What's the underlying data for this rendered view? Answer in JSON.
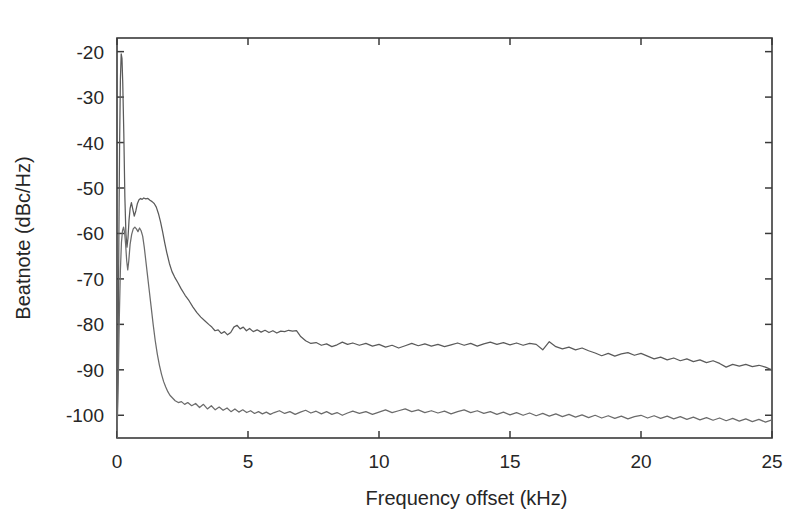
{
  "chart_data": {
    "type": "line",
    "title": "",
    "subtitle": "",
    "xlabel": "Frequency offset (kHz)",
    "ylabel": "Beatnote (dBc/Hz)",
    "xlim": [
      0,
      25
    ],
    "ylim": [
      -105,
      -17
    ],
    "xticks": [
      0,
      5,
      10,
      15,
      20,
      25
    ],
    "xtick_labels": [
      "0",
      "5",
      "10",
      "15",
      "20",
      "25"
    ],
    "yticks": [
      -20,
      -30,
      -40,
      -50,
      -60,
      -70,
      -80,
      -90,
      -100
    ],
    "ytick_labels": [
      "-20",
      "-30",
      "-40",
      "-50",
      "-60",
      "-70",
      "-80",
      "-90",
      "-100"
    ],
    "grid": false,
    "legend": "none",
    "box": true,
    "tick_direction": "in",
    "line_color": "#555555",
    "axis_color": "#3a3a3a",
    "background": "#ffffff",
    "series": [
      {
        "name": "upper-trace",
        "color": "#5a5a5a",
        "x": [
          0.0,
          0.04,
          0.07,
          0.1,
          0.13,
          0.16,
          0.19,
          0.22,
          0.26,
          0.3,
          0.34,
          0.38,
          0.42,
          0.46,
          0.5,
          0.55,
          0.6,
          0.66,
          0.72,
          0.78,
          0.84,
          0.9,
          0.96,
          1.02,
          1.1,
          1.18,
          1.26,
          1.34,
          1.42,
          1.5,
          1.58,
          1.66,
          1.74,
          1.82,
          1.9,
          2.0,
          2.1,
          2.2,
          2.32,
          2.45,
          2.6,
          2.75,
          2.9,
          3.05,
          3.2,
          3.35,
          3.5,
          3.62,
          3.74,
          3.86,
          3.98,
          4.1,
          4.22,
          4.34,
          4.46,
          4.58,
          4.7,
          4.82,
          4.94,
          5.06,
          5.2,
          5.35,
          5.5,
          5.65,
          5.8,
          5.95,
          6.1,
          6.25,
          6.4,
          6.55,
          6.7,
          6.85,
          7.0,
          7.2,
          7.4,
          7.6,
          7.8,
          8.0,
          8.2,
          8.4,
          8.6,
          8.8,
          9.0,
          9.25,
          9.5,
          9.75,
          10.0,
          10.25,
          10.5,
          10.75,
          11.0,
          11.25,
          11.5,
          11.75,
          12.0,
          12.25,
          12.5,
          12.75,
          13.0,
          13.25,
          13.5,
          13.75,
          14.0,
          14.25,
          14.5,
          14.75,
          15.0,
          15.25,
          15.5,
          15.75,
          16.0,
          16.25,
          16.5,
          16.75,
          17.0,
          17.25,
          17.5,
          17.75,
          18.0,
          18.25,
          18.5,
          18.75,
          19.0,
          19.25,
          19.5,
          19.75,
          20.0,
          20.25,
          20.5,
          20.75,
          21.0,
          21.25,
          21.5,
          21.75,
          22.0,
          22.25,
          22.5,
          22.75,
          23.0,
          23.25,
          23.5,
          23.75,
          24.0,
          24.25,
          24.5,
          24.75,
          25.0
        ],
        "y": [
          -105,
          -88,
          -62,
          -40,
          -26,
          -20.5,
          -21.5,
          -27,
          -38,
          -52,
          -60,
          -63,
          -61,
          -57,
          -54.5,
          -53.2,
          -54.6,
          -56.2,
          -55.0,
          -53.4,
          -52.6,
          -52.3,
          -52.5,
          -52.2,
          -52.4,
          -52.3,
          -52.7,
          -53.0,
          -53.4,
          -54.2,
          -55.6,
          -57.4,
          -59.6,
          -62.0,
          -64.2,
          -66.6,
          -68.4,
          -69.6,
          -70.8,
          -72.2,
          -73.6,
          -74.8,
          -76.2,
          -77.4,
          -78.4,
          -79.2,
          -80.0,
          -80.6,
          -81.4,
          -81.2,
          -82.0,
          -81.6,
          -82.3,
          -81.8,
          -80.6,
          -80.2,
          -81.0,
          -80.6,
          -81.4,
          -80.9,
          -81.6,
          -81.2,
          -81.7,
          -81.3,
          -81.8,
          -81.4,
          -81.9,
          -81.5,
          -81.6,
          -81.3,
          -81.5,
          -81.4,
          -82.6,
          -83.6,
          -84.2,
          -84.0,
          -84.6,
          -84.3,
          -84.9,
          -84.5,
          -83.9,
          -84.4,
          -84.1,
          -84.6,
          -84.2,
          -84.8,
          -84.4,
          -85.0,
          -84.6,
          -85.2,
          -84.7,
          -84.2,
          -84.7,
          -84.3,
          -84.8,
          -84.4,
          -84.9,
          -84.5,
          -84.1,
          -84.6,
          -84.2,
          -84.8,
          -84.3,
          -83.9,
          -84.4,
          -84.0,
          -84.5,
          -84.1,
          -84.6,
          -84.2,
          -84.4,
          -85.6,
          -83.8,
          -84.9,
          -85.4,
          -85.0,
          -85.6,
          -85.2,
          -85.8,
          -86.3,
          -86.9,
          -86.4,
          -87.0,
          -86.5,
          -86.2,
          -86.8,
          -86.4,
          -87.0,
          -87.6,
          -87.2,
          -87.8,
          -87.4,
          -88.0,
          -87.6,
          -88.2,
          -87.8,
          -88.4,
          -88.0,
          -88.6,
          -89.4,
          -88.8,
          -89.2,
          -88.8,
          -89.3,
          -89.0,
          -89.4,
          -90.0
        ]
      },
      {
        "name": "lower-trace",
        "color": "#6b6b6b",
        "x": [
          0.0,
          0.05,
          0.09,
          0.13,
          0.17,
          0.21,
          0.25,
          0.29,
          0.33,
          0.37,
          0.41,
          0.45,
          0.5,
          0.56,
          0.62,
          0.68,
          0.74,
          0.8,
          0.86,
          0.92,
          0.98,
          1.04,
          1.1,
          1.16,
          1.22,
          1.3,
          1.38,
          1.46,
          1.54,
          1.62,
          1.7,
          1.78,
          1.86,
          1.94,
          2.02,
          2.12,
          2.22,
          2.34,
          2.46,
          2.58,
          2.7,
          2.85,
          3.0,
          3.15,
          3.3,
          3.45,
          3.6,
          3.75,
          3.9,
          4.05,
          4.2,
          4.35,
          4.5,
          4.65,
          4.8,
          4.95,
          5.1,
          5.25,
          5.4,
          5.55,
          5.7,
          5.85,
          6.0,
          6.2,
          6.4,
          6.6,
          6.8,
          7.0,
          7.2,
          7.4,
          7.6,
          7.8,
          8.0,
          8.2,
          8.4,
          8.6,
          8.8,
          9.0,
          9.25,
          9.5,
          9.75,
          10.0,
          10.25,
          10.5,
          10.75,
          11.0,
          11.25,
          11.5,
          11.75,
          12.0,
          12.25,
          12.5,
          12.75,
          13.0,
          13.25,
          13.5,
          13.75,
          14.0,
          14.25,
          14.5,
          14.75,
          15.0,
          15.25,
          15.5,
          15.75,
          16.0,
          16.25,
          16.5,
          16.75,
          17.0,
          17.25,
          17.5,
          17.75,
          18.0,
          18.25,
          18.5,
          18.75,
          19.0,
          19.25,
          19.5,
          19.75,
          20.0,
          20.25,
          20.5,
          20.75,
          21.0,
          21.25,
          21.5,
          21.75,
          22.0,
          22.25,
          22.5,
          22.75,
          23.0,
          23.25,
          23.5,
          23.75,
          24.0,
          24.25,
          24.5,
          24.75,
          25.0
        ],
        "y": [
          -105,
          -92,
          -78,
          -68,
          -62,
          -59.4,
          -58.6,
          -59.8,
          -62.5,
          -66,
          -68,
          -66,
          -62.4,
          -60.2,
          -59.0,
          -58.6,
          -59.0,
          -59.6,
          -58.8,
          -59.4,
          -60.6,
          -63.0,
          -66.0,
          -69.0,
          -72.0,
          -76.0,
          -80.0,
          -83.6,
          -86.6,
          -89.0,
          -91.0,
          -92.6,
          -93.8,
          -94.8,
          -95.6,
          -96.2,
          -96.8,
          -97.2,
          -97.0,
          -97.6,
          -97.2,
          -97.9,
          -97.4,
          -98.3,
          -97.6,
          -98.6,
          -97.9,
          -98.8,
          -98.2,
          -98.9,
          -98.4,
          -99.2,
          -98.6,
          -99.3,
          -98.8,
          -99.4,
          -99.0,
          -99.6,
          -99.2,
          -99.7,
          -99.3,
          -99.8,
          -99.4,
          -99.0,
          -99.6,
          -99.2,
          -99.8,
          -99.3,
          -98.9,
          -99.5,
          -99.1,
          -99.7,
          -99.2,
          -99.8,
          -99.4,
          -100.0,
          -99.5,
          -99.1,
          -99.6,
          -99.2,
          -99.8,
          -99.3,
          -98.8,
          -99.4,
          -99.0,
          -98.6,
          -99.2,
          -98.8,
          -99.4,
          -99.0,
          -99.5,
          -99.1,
          -99.7,
          -99.2,
          -98.8,
          -99.4,
          -99.0,
          -99.6,
          -99.2,
          -99.8,
          -99.3,
          -99.9,
          -99.4,
          -100.0,
          -99.5,
          -100.1,
          -99.6,
          -100.2,
          -99.7,
          -100.3,
          -99.8,
          -100.4,
          -99.9,
          -100.5,
          -100.0,
          -100.6,
          -100.1,
          -100.7,
          -100.2,
          -100.8,
          -100.3,
          -100.0,
          -100.6,
          -100.1,
          -100.7,
          -100.2,
          -100.8,
          -100.3,
          -100.9,
          -100.4,
          -101.0,
          -100.5,
          -101.1,
          -100.6,
          -101.2,
          -100.7,
          -101.3,
          -100.8,
          -101.4,
          -100.9,
          -101.5,
          -101.0
        ]
      }
    ]
  }
}
